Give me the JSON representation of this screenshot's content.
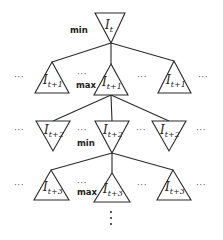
{
  "diagram": {
    "levels": [
      {
        "role": "min",
        "orientation": "down",
        "nodes": [
          {
            "label": "I",
            "subscript": "t"
          }
        ]
      },
      {
        "role": "max",
        "orientation": "up",
        "nodes": [
          {
            "label": "I",
            "subscript": "t+1"
          },
          {
            "label": "I",
            "subscript": "t+1"
          },
          {
            "label": "I",
            "subscript": "t+1"
          }
        ]
      },
      {
        "role": "min",
        "orientation": "down",
        "nodes": [
          {
            "label": "I",
            "subscript": "t+2"
          },
          {
            "label": "I",
            "subscript": "t+2"
          },
          {
            "label": "I",
            "subscript": "t+2"
          }
        ]
      },
      {
        "role": "max",
        "orientation": "up",
        "nodes": [
          {
            "label": "I",
            "subscript": "t+3"
          },
          {
            "label": "I",
            "subscript": "t+3"
          },
          {
            "label": "I",
            "subscript": "t+3"
          }
        ]
      }
    ],
    "ellipsis": "···",
    "continuation": "⋮",
    "colors": {
      "stroke": "#2a2a2a",
      "text": "#222222",
      "background": "#ffffff"
    }
  }
}
